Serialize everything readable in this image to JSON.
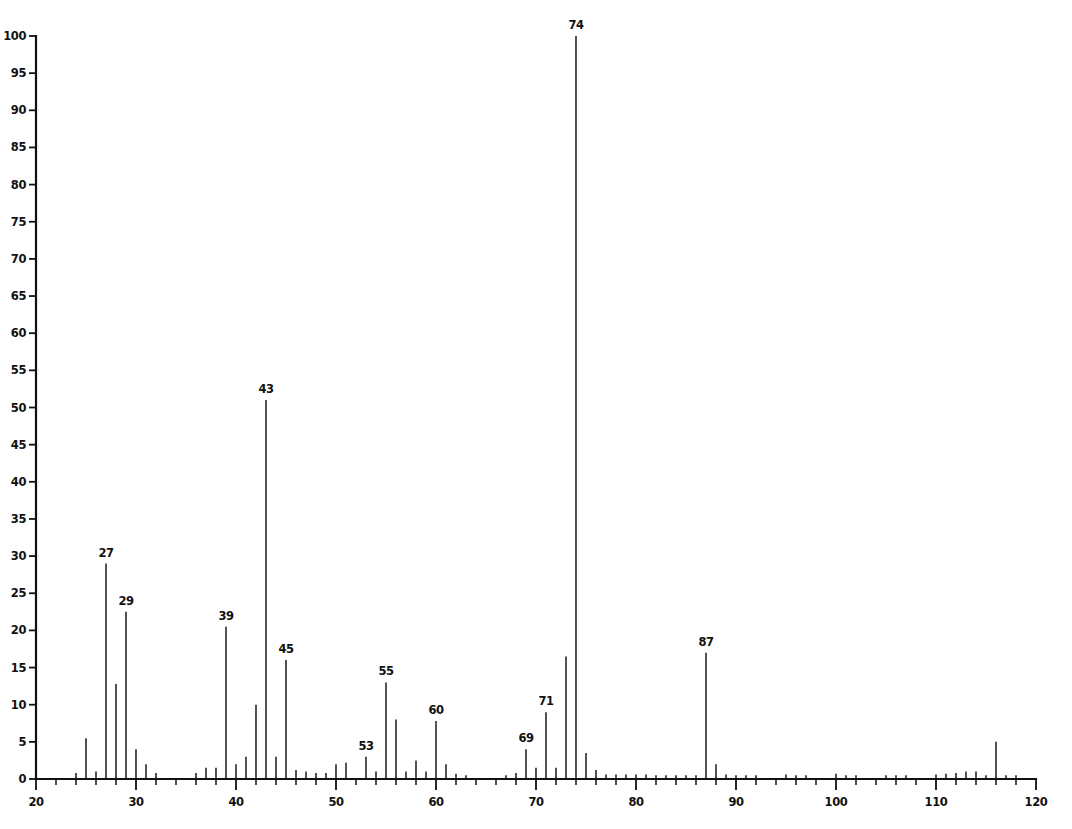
{
  "chart_data": {
    "type": "bar",
    "title": "",
    "subtitle": "",
    "xlabel": "",
    "ylabel": "",
    "xlim": [
      20,
      120
    ],
    "ylim": [
      0,
      100
    ],
    "grid": false,
    "legend": null,
    "x_tick_labels": [
      "20",
      "30",
      "40",
      "50",
      "60",
      "70",
      "80",
      "90",
      "100",
      "110",
      "120"
    ],
    "x_tick_values": [
      20,
      30,
      40,
      50,
      60,
      70,
      80,
      90,
      100,
      110,
      120
    ],
    "x_minor_tick_step": 2,
    "y_tick_labels": [
      "0",
      "5",
      "10",
      "15",
      "20",
      "25",
      "30",
      "35",
      "40",
      "45",
      "50",
      "55",
      "60",
      "65",
      "70",
      "75",
      "80",
      "85",
      "90",
      "95",
      "100"
    ],
    "y_tick_values": [
      0,
      5,
      10,
      15,
      20,
      25,
      30,
      35,
      40,
      45,
      50,
      55,
      60,
      65,
      70,
      75,
      80,
      85,
      90,
      95,
      100
    ],
    "x": [
      24,
      25,
      26,
      27,
      28,
      29,
      30,
      31,
      32,
      36,
      37,
      38,
      39,
      40,
      41,
      42,
      43,
      44,
      45,
      46,
      47,
      48,
      49,
      50,
      51,
      53,
      54,
      55,
      56,
      57,
      58,
      59,
      60,
      61,
      62,
      63,
      67,
      68,
      69,
      70,
      71,
      72,
      73,
      74,
      75,
      76,
      77,
      78,
      79,
      80,
      81,
      82,
      83,
      84,
      85,
      86,
      87,
      88,
      89,
      90,
      91,
      92,
      95,
      96,
      97,
      100,
      101,
      102,
      105,
      106,
      107,
      110,
      111,
      112,
      113,
      114,
      115,
      116,
      117,
      118
    ],
    "values": [
      0.8,
      5.5,
      1.0,
      29.0,
      12.8,
      22.5,
      4.0,
      2.0,
      0.8,
      0.8,
      1.5,
      1.5,
      20.5,
      2.0,
      3.0,
      10.0,
      51.0,
      3.0,
      16.0,
      1.2,
      1.0,
      0.8,
      0.8,
      2.0,
      2.2,
      3.0,
      1.0,
      13.0,
      8.0,
      1.0,
      2.5,
      1.0,
      7.8,
      2.0,
      0.7,
      0.5,
      0.5,
      0.8,
      4.0,
      1.5,
      9.0,
      1.5,
      16.5,
      100.0,
      3.5,
      1.2,
      0.6,
      0.6,
      0.6,
      0.6,
      0.6,
      0.5,
      0.5,
      0.5,
      0.5,
      0.5,
      17.0,
      2.0,
      0.6,
      0.5,
      0.5,
      0.5,
      0.6,
      0.5,
      0.5,
      0.7,
      0.5,
      0.5,
      0.5,
      0.5,
      0.5,
      0.6,
      0.7,
      0.8,
      1.0,
      1.0,
      0.5,
      5.0,
      0.5,
      0.5
    ],
    "labeled_peaks": [
      {
        "mz": 27,
        "intensity": 29.0,
        "label": "27"
      },
      {
        "mz": 29,
        "intensity": 22.5,
        "label": "29"
      },
      {
        "mz": 39,
        "intensity": 20.5,
        "label": "39"
      },
      {
        "mz": 43,
        "intensity": 51.0,
        "label": "43"
      },
      {
        "mz": 45,
        "intensity": 16.0,
        "label": "45"
      },
      {
        "mz": 53,
        "intensity": 3.0,
        "label": "53"
      },
      {
        "mz": 55,
        "intensity": 13.0,
        "label": "55"
      },
      {
        "mz": 60,
        "intensity": 7.8,
        "label": "60"
      },
      {
        "mz": 69,
        "intensity": 4.0,
        "label": "69"
      },
      {
        "mz": 71,
        "intensity": 9.0,
        "label": "71"
      },
      {
        "mz": 74,
        "intensity": 100.0,
        "label": "74"
      },
      {
        "mz": 87,
        "intensity": 17.0,
        "label": "87"
      }
    ],
    "colors": {
      "axis": "#111111",
      "peaks": "#111111",
      "background": "#ffffff"
    }
  }
}
